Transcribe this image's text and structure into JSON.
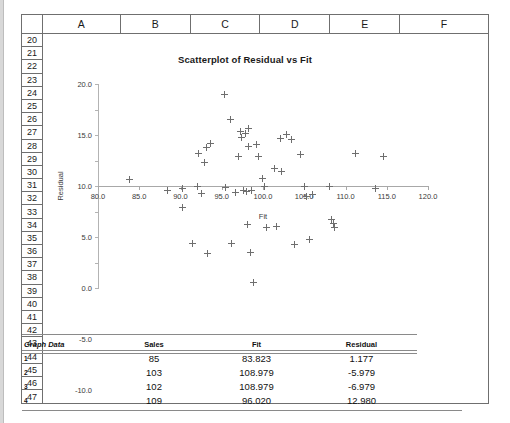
{
  "spreadsheet": {
    "columns": [
      "A",
      "B",
      "C",
      "D",
      "E",
      "F"
    ],
    "rows": [
      "20",
      "21",
      "22",
      "23",
      "24",
      "25",
      "26",
      "27",
      "28",
      "29",
      "30",
      "31",
      "32",
      "33",
      "34",
      "35",
      "36",
      "37",
      "38",
      "39",
      "40",
      "41",
      "42",
      "43",
      "44",
      "45",
      "46",
      "47"
    ]
  },
  "chart_data": {
    "type": "scatter",
    "title": "Scatterplot of Residual vs Fit",
    "xlabel": "Fit",
    "ylabel": "Residual",
    "xlim": [
      80.0,
      120.0
    ],
    "ylim": [
      -20.0,
      20.0
    ],
    "xticks": [
      "80.0",
      "85.0",
      "90.0",
      "95.0",
      "100.0",
      "105.0",
      "110.0",
      "115.0",
      "120.0"
    ],
    "yticks": [
      "20.0",
      "15.0",
      "10.0",
      "5.0",
      "0.0",
      "-5.0",
      "-10.0",
      "-15.0",
      "-20.0"
    ],
    "grid": false,
    "legend": false,
    "marker": "plus",
    "marker_color": "#6e6e6e",
    "points": [
      [
        83.8,
        1.2
      ],
      [
        88.4,
        -0.9
      ],
      [
        90.2,
        -0.4
      ],
      [
        90.3,
        -4.2
      ],
      [
        91.5,
        -11.3
      ],
      [
        92.0,
        0.0
      ],
      [
        92.2,
        6.4
      ],
      [
        92.6,
        -1.4
      ],
      [
        92.9,
        4.6
      ],
      [
        93.1,
        7.5
      ],
      [
        93.3,
        -13.2
      ],
      [
        93.6,
        8.3
      ],
      [
        95.3,
        18.0
      ],
      [
        95.5,
        -0.3
      ],
      [
        96.0,
        13.0
      ],
      [
        96.2,
        -11.3
      ],
      [
        96.7,
        -1.3
      ],
      [
        97.0,
        5.7
      ],
      [
        97.3,
        10.6
      ],
      [
        97.4,
        9.6
      ],
      [
        97.6,
        -0.9
      ],
      [
        97.9,
        10.2
      ],
      [
        98.0,
        -1.1
      ],
      [
        98.1,
        -7.5
      ],
      [
        98.2,
        7.7
      ],
      [
        98.3,
        11.2
      ],
      [
        98.5,
        -13.0
      ],
      [
        98.6,
        -0.9
      ],
      [
        98.8,
        -19.0
      ],
      [
        99.2,
        8.1
      ],
      [
        99.5,
        5.8
      ],
      [
        99.9,
        1.5
      ],
      [
        100.2,
        0.0
      ],
      [
        100.4,
        -8.2
      ],
      [
        101.4,
        3.4
      ],
      [
        101.6,
        -8.0
      ],
      [
        102.1,
        9.3
      ],
      [
        102.3,
        2.9
      ],
      [
        102.9,
        10.1
      ],
      [
        103.4,
        9.2
      ],
      [
        103.8,
        -11.5
      ],
      [
        104.5,
        6.2
      ],
      [
        105.0,
        0.0
      ],
      [
        105.3,
        -2.0
      ],
      [
        105.6,
        -10.5
      ],
      [
        106.0,
        -1.7
      ],
      [
        108.0,
        0.0
      ],
      [
        108.3,
        -6.5
      ],
      [
        108.6,
        -7.3
      ],
      [
        108.7,
        -8.2
      ],
      [
        111.2,
        6.3
      ],
      [
        113.6,
        -0.5
      ],
      [
        114.6,
        5.8
      ]
    ]
  },
  "table": {
    "label": "Graph Data",
    "headers": [
      "Sales",
      "Fit",
      "Residual"
    ],
    "rows": [
      {
        "idx": "1",
        "sales": "85",
        "fit": "83.823",
        "residual": "1.177"
      },
      {
        "idx": "2",
        "sales": "103",
        "fit": "108.979",
        "residual": "-5.979"
      },
      {
        "idx": "3",
        "sales": "102",
        "fit": "108.979",
        "residual": "-6.979"
      },
      {
        "idx": "4",
        "sales": "109",
        "fit": "96.020",
        "residual": "12.980"
      }
    ]
  }
}
